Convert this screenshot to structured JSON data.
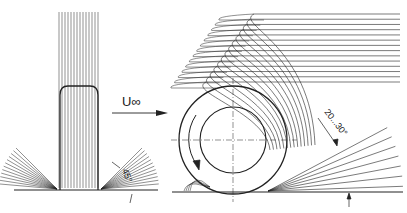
{
  "diagram": {
    "labels": {
      "velocity": "U∞",
      "front_angle": "45°",
      "side_angle": "20...30°"
    },
    "colors": {
      "line": "#222222",
      "background": "#ffffff"
    },
    "front_view": {
      "vertical_streamline_count": 14,
      "side_spray_fan_count": 12
    },
    "side_view": {
      "spray_arc_count": 14,
      "rear_fan_count": 7,
      "rotation": "clockwise arrow on wheel"
    }
  }
}
